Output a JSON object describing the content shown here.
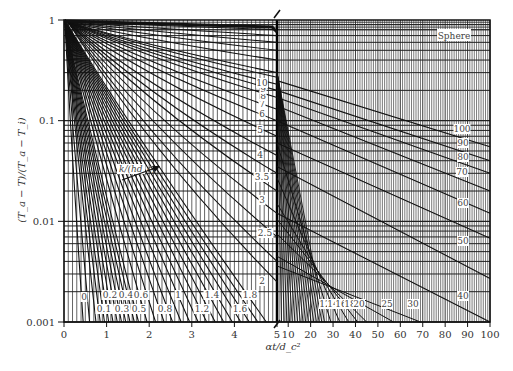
{
  "chart_data": {
    "type": "line",
    "title": "",
    "annotation": "Sphere",
    "xlabel": "αt/d_c²",
    "ylabel": "(T_a − T)/(T_a − T_i)",
    "yscale": "log",
    "ylim": [
      0.001,
      1
    ],
    "y_ticks": [
      "1",
      "0.1",
      "0.01",
      "0.001"
    ],
    "x_panels": [
      {
        "name": "left",
        "xlim": [
          0,
          5
        ],
        "x_ticks": [
          "0",
          "1",
          "2",
          "3",
          "4",
          "5"
        ]
      },
      {
        "name": "right",
        "xlim": [
          5,
          100
        ],
        "x_ticks": [
          "10",
          "20",
          "30",
          "40",
          "50",
          "60",
          "70",
          "80",
          "90",
          "100"
        ]
      }
    ],
    "grid": true,
    "legend": null,
    "parameter": "k/(hd_c)",
    "parameter_arrow_label": "k/(hd_c)",
    "series_left_bottom_labels": [
      "0",
      "0.1",
      "0.2",
      "0.3",
      "0.4",
      "0.5",
      "0.6",
      "0.8",
      "1",
      "1.2",
      "1.4",
      "1.6",
      "1.8",
      "2"
    ],
    "series_left_mid_labels": [
      "2.5",
      "3",
      "3.5",
      "4",
      "5",
      "6",
      "7",
      "8",
      "9",
      "10"
    ],
    "series_right_bottom_labels": [
      "12",
      "14",
      "16",
      "18",
      "20",
      "25",
      "30"
    ],
    "series_right_side_labels": [
      "40",
      "50",
      "60",
      "70",
      "80",
      "90",
      "100"
    ],
    "series": [
      {
        "name": "0",
        "panel": "left",
        "x_at_0.001": 0.45
      },
      {
        "name": "0.1",
        "panel": "left",
        "x_at_0.001": 0.75
      },
      {
        "name": "0.2",
        "panel": "left",
        "x_at_0.001": 0.95
      },
      {
        "name": "0.3",
        "panel": "left",
        "x_at_0.001": 1.15
      },
      {
        "name": "0.4",
        "panel": "left",
        "x_at_0.001": 1.35
      },
      {
        "name": "0.5",
        "panel": "left",
        "x_at_0.001": 1.55
      },
      {
        "name": "0.6",
        "panel": "left",
        "x_at_0.001": 1.75
      },
      {
        "name": "0.8",
        "panel": "left",
        "x_at_0.001": 2.15
      },
      {
        "name": "1",
        "panel": "left",
        "x_at_0.001": 2.55
      },
      {
        "name": "1.2",
        "panel": "left",
        "x_at_0.001": 2.95
      },
      {
        "name": "1.4",
        "panel": "left",
        "x_at_0.001": 3.35
      },
      {
        "name": "1.6",
        "panel": "left",
        "x_at_0.001": 3.75
      },
      {
        "name": "1.8",
        "panel": "left",
        "x_at_0.001": 4.15
      },
      {
        "name": "2",
        "panel": "left",
        "x_at_0.001": 4.55
      },
      {
        "name": "2.5",
        "panel": "left",
        "x_at_y5": 0.007
      },
      {
        "name": "3",
        "panel": "left",
        "x_at_y5": 0.015
      },
      {
        "name": "3.5",
        "panel": "left",
        "x_at_y5": 0.025
      },
      {
        "name": "4",
        "panel": "left",
        "x_at_y5": 0.035
      },
      {
        "name": "5",
        "panel": "left",
        "x_at_y5": 0.07
      },
      {
        "name": "10",
        "panel": "left",
        "x_at_y5": 0.3
      },
      {
        "name": "12",
        "panel": "right",
        "x_at_0.001": 27
      },
      {
        "name": "20",
        "panel": "right",
        "x_at_0.001": 45
      },
      {
        "name": "30",
        "panel": "right",
        "x_at_0.001": 69
      },
      {
        "name": "40",
        "panel": "right",
        "x_at_0.001": 91
      },
      {
        "name": "100",
        "panel": "right",
        "y_at_100": 0.055
      }
    ]
  }
}
